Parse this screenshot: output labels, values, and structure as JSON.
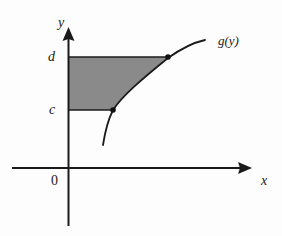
{
  "figure": {
    "kind": "cartesian-plot",
    "background_color": "#fdfdfd",
    "ink_color": "#1a1a1a",
    "shaded_region_color": "#8a8a8a"
  },
  "axes": {
    "x_axis_label": "x",
    "y_axis_label": "y",
    "origin_label": "0",
    "x_axis": {
      "start_px": 12,
      "end_px": 252,
      "y_px": 168,
      "arrow": "right"
    },
    "y_axis": {
      "top_px": 27,
      "bottom_px": 226,
      "x_px": 68,
      "arrow": "up"
    }
  },
  "ticks": {
    "y": [
      {
        "label": "c",
        "y_px": 110
      },
      {
        "label": "d",
        "y_px": 57
      }
    ]
  },
  "curve": {
    "label": "g(y)",
    "points_px": [
      [
        103,
        145
      ],
      [
        106,
        131
      ],
      [
        110,
        119
      ],
      [
        113,
        110
      ],
      [
        121,
        99
      ],
      [
        131,
        89
      ],
      [
        143,
        78
      ],
      [
        155,
        68
      ],
      [
        168,
        58
      ],
      [
        182,
        50
      ],
      [
        194,
        44
      ],
      [
        205,
        40
      ]
    ]
  },
  "markers": [
    {
      "name": "point-on-curve-at-c",
      "x_px": 113,
      "y_px": 110
    },
    {
      "name": "point-on-curve-at-d",
      "x_px": 168,
      "y_px": 57
    }
  ],
  "horizontal_segments": [
    {
      "name": "segment-d",
      "x1_px": 68,
      "x2_px": 168,
      "y_px": 57
    },
    {
      "name": "segment-c",
      "x1_px": 68,
      "x2_px": 113,
      "y_px": 110
    }
  ],
  "shaded_region": {
    "outline_px": [
      [
        68,
        57
      ],
      [
        168,
        57
      ],
      [
        155,
        68
      ],
      [
        143,
        78
      ],
      [
        131,
        89
      ],
      [
        121,
        99
      ],
      [
        113,
        110
      ],
      [
        68,
        110
      ]
    ]
  }
}
